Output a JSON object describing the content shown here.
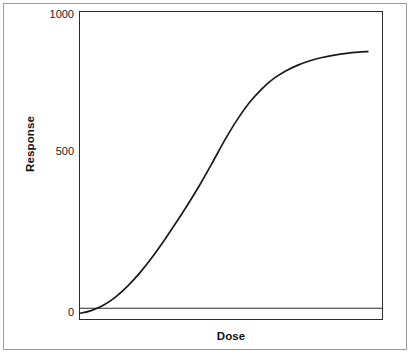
{
  "chart_data": {
    "type": "line",
    "title": "",
    "xlabel": "Dose",
    "ylabel": "Response",
    "ylim": [
      -40,
      1010
    ],
    "xlim": [
      0,
      100
    ],
    "yticks": [
      0,
      500,
      1000
    ],
    "ytick_labels": [
      "0",
      "500",
      "1000"
    ],
    "xticks": [],
    "xtick_labels": [],
    "grid": false,
    "legend": false,
    "legend_position": "none",
    "line_color": "#1a1a1a",
    "background_color": "#ffffff",
    "frame_color": "#2b2b2b",
    "outer_border_color": "#9a9a9a",
    "annotations": [],
    "series": [
      {
        "name": "dose-response",
        "shape": "sigmoid",
        "x": [
          0,
          4,
          8,
          12,
          16,
          20,
          24,
          28,
          32,
          36,
          40,
          44,
          48,
          52,
          56,
          60,
          64,
          68,
          72,
          76,
          80,
          84,
          88,
          92,
          95
        ],
        "values": [
          -18,
          -8,
          10,
          38,
          75,
          120,
          172,
          230,
          292,
          356,
          424,
          497,
          572,
          640,
          698,
          744,
          780,
          806,
          826,
          841,
          852,
          860,
          866,
          870,
          872
        ]
      }
    ]
  },
  "axis": {
    "y_title": "Response",
    "x_title": "Dose",
    "tick_1000": "1000",
    "tick_500": "500",
    "tick_0": "0"
  }
}
